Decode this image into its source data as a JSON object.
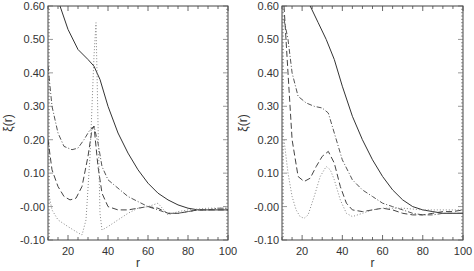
{
  "figure": {
    "panels": 2,
    "line_styles": [
      "solid",
      "dash-dot",
      "dashed",
      "dotted"
    ]
  },
  "chart_data": [
    {
      "type": "line",
      "panel": "left",
      "title": "",
      "xlabel": "r",
      "ylabel": "ξ(r)",
      "xlim": [
        10,
        100
      ],
      "ylim": [
        -0.1,
        0.6
      ],
      "xticks": [
        "20",
        "40",
        "60",
        "80",
        "100"
      ],
      "yticks": [
        "-0.10",
        "-0.00",
        "0.10",
        "0.20",
        "0.30",
        "0.40",
        "0.50",
        "0.60"
      ],
      "grid": false,
      "legend": null,
      "series": [
        {
          "name": "solid",
          "style": "solid",
          "x": [
            16,
            20,
            25,
            30,
            33,
            36,
            40,
            45,
            50,
            55,
            60,
            65,
            70,
            75,
            80,
            85,
            90,
            95,
            100
          ],
          "y": [
            0.6,
            0.53,
            0.47,
            0.44,
            0.42,
            0.38,
            0.3,
            0.22,
            0.16,
            0.11,
            0.07,
            0.04,
            0.02,
            0.005,
            -0.005,
            -0.01,
            -0.01,
            -0.01,
            -0.01
          ]
        },
        {
          "name": "dash-dot",
          "style": "dash-dot",
          "x": [
            10,
            12,
            15,
            18,
            22,
            25,
            28,
            31,
            33,
            35,
            37,
            40,
            45,
            50,
            55,
            60,
            65,
            70,
            75,
            80,
            85,
            90,
            95,
            100
          ],
          "y": [
            0.42,
            0.3,
            0.22,
            0.18,
            0.17,
            0.175,
            0.2,
            0.23,
            0.24,
            0.19,
            0.12,
            0.08,
            0.055,
            0.03,
            0.015,
            0.0,
            -0.01,
            -0.02,
            -0.02,
            -0.015,
            -0.01,
            -0.01,
            -0.005,
            -0.005
          ]
        },
        {
          "name": "dashed",
          "style": "dashed",
          "x": [
            10,
            12,
            15,
            18,
            21,
            24,
            27,
            30,
            32,
            33,
            35,
            37,
            40,
            45,
            50,
            55,
            60,
            65,
            70,
            75,
            80,
            85,
            90,
            95,
            100
          ],
          "y": [
            0.2,
            0.11,
            0.06,
            0.03,
            0.02,
            0.025,
            0.06,
            0.15,
            0.23,
            0.24,
            0.12,
            0.04,
            0.0,
            -0.01,
            -0.01,
            -0.005,
            0.0,
            -0.005,
            -0.02,
            -0.02,
            -0.015,
            -0.01,
            -0.01,
            -0.01,
            -0.01
          ]
        },
        {
          "name": "dotted",
          "style": "dotted",
          "x": [
            10,
            12,
            15,
            20,
            24,
            27,
            29,
            31,
            33,
            34,
            35,
            36,
            37,
            40,
            45,
            50,
            55,
            60,
            65,
            70,
            75,
            80,
            90,
            100
          ],
          "y": [
            0.05,
            -0.01,
            -0.04,
            -0.06,
            -0.075,
            -0.085,
            -0.04,
            0.15,
            0.45,
            0.55,
            0.25,
            -0.02,
            -0.07,
            -0.06,
            -0.04,
            -0.02,
            -0.005,
            0.0,
            0.01,
            -0.025,
            -0.015,
            -0.01,
            -0.005,
            -0.005
          ]
        }
      ]
    },
    {
      "type": "line",
      "panel": "right",
      "title": "",
      "xlabel": "r",
      "ylabel": "ξ(r)",
      "xlim": [
        10,
        100
      ],
      "ylim": [
        -0.1,
        0.6
      ],
      "xticks": [
        "20",
        "40",
        "60",
        "80",
        "100"
      ],
      "yticks": [
        "-0.10",
        "-0.00",
        "0.10",
        "0.20",
        "0.30",
        "0.40",
        "0.50",
        "0.60"
      ],
      "grid": false,
      "legend": null,
      "series": [
        {
          "name": "solid",
          "style": "solid",
          "x": [
            24,
            28,
            32,
            36,
            40,
            45,
            50,
            55,
            60,
            65,
            70,
            75,
            80,
            85,
            90,
            95,
            100
          ],
          "y": [
            0.6,
            0.55,
            0.5,
            0.44,
            0.36,
            0.27,
            0.2,
            0.14,
            0.09,
            0.05,
            0.02,
            0.0,
            -0.01,
            -0.015,
            -0.02,
            -0.02,
            -0.02
          ]
        },
        {
          "name": "dash-dot",
          "style": "dash-dot",
          "x": [
            11,
            13,
            15,
            18,
            22,
            26,
            30,
            33,
            36,
            40,
            45,
            50,
            55,
            60,
            65,
            70,
            75,
            80,
            85,
            90,
            95,
            100
          ],
          "y": [
            0.56,
            0.5,
            0.4,
            0.33,
            0.31,
            0.3,
            0.295,
            0.28,
            0.22,
            0.14,
            0.08,
            0.05,
            0.03,
            0.01,
            0.0,
            -0.01,
            -0.02,
            -0.025,
            -0.025,
            -0.02,
            -0.02,
            -0.02
          ]
        },
        {
          "name": "dashed",
          "style": "dashed",
          "x": [
            11,
            13,
            15,
            18,
            21,
            24,
            27,
            30,
            33,
            36,
            39,
            42,
            45,
            50,
            55,
            60,
            65,
            70,
            75,
            80,
            85,
            90,
            95,
            100
          ],
          "y": [
            0.6,
            0.4,
            0.2,
            0.09,
            0.075,
            0.085,
            0.12,
            0.15,
            0.165,
            0.13,
            0.06,
            0.01,
            -0.01,
            -0.015,
            -0.01,
            -0.005,
            -0.01,
            -0.02,
            -0.025,
            -0.025,
            -0.02,
            -0.015,
            -0.015,
            -0.01
          ]
        },
        {
          "name": "dotted",
          "style": "dotted",
          "x": [
            11,
            13,
            15,
            17,
            19,
            21,
            23,
            26,
            29,
            32,
            34,
            36,
            39,
            42,
            45,
            50,
            55,
            60,
            70,
            80,
            90,
            100
          ],
          "y": [
            0.2,
            0.1,
            0.03,
            -0.01,
            -0.03,
            -0.035,
            -0.025,
            0.03,
            0.09,
            0.12,
            0.11,
            0.08,
            0.02,
            -0.02,
            -0.03,
            -0.02,
            -0.01,
            -0.005,
            -0.005,
            -0.01,
            -0.01,
            -0.01
          ]
        }
      ]
    }
  ]
}
